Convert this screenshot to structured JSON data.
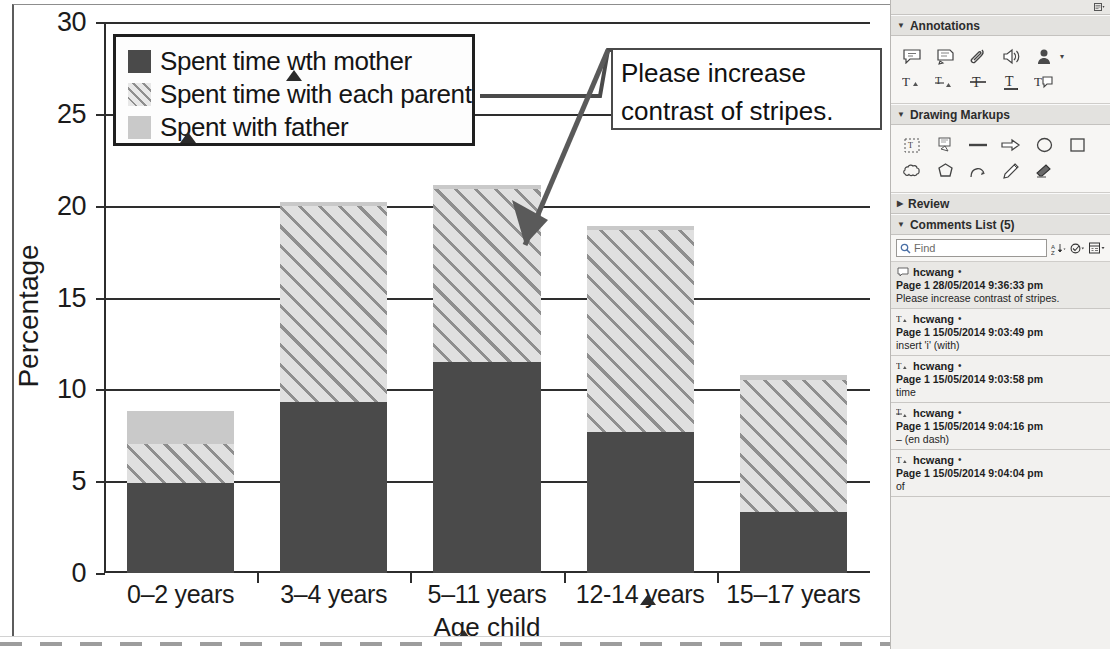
{
  "chart_data": {
    "type": "bar",
    "subtype": "stacked",
    "title": "",
    "xlabel": "Age child",
    "ylabel": "Percentage",
    "ylim": [
      0,
      30
    ],
    "yticks": [
      0,
      5,
      10,
      15,
      20,
      25,
      30
    ],
    "ytick_labels": [
      "0",
      "5",
      "10",
      "15",
      "20",
      "25",
      "30"
    ],
    "grid": true,
    "legend_position": "top-left",
    "categories": [
      "0–2 years",
      "3–4 years",
      "5–11 years",
      "12-14 years",
      "15–17 years"
    ],
    "series": [
      {
        "name": "Spent time wth mother",
        "key": "mother",
        "color": "#4a4a4a",
        "pattern": "solid-dark",
        "values": [
          4.9,
          9.3,
          11.5,
          7.7,
          3.3
        ]
      },
      {
        "name": "Spent time with each parent",
        "key": "each_parent",
        "color": "#e0e0e0",
        "pattern": "diagonal-stripes",
        "values": [
          2.1,
          10.7,
          9.4,
          11.0,
          7.2
        ]
      },
      {
        "name": "Spent with father",
        "key": "father",
        "color": "#c9c9c9",
        "pattern": "solid-light",
        "values": [
          1.8,
          0.2,
          0.2,
          0.2,
          0.3
        ]
      }
    ],
    "totals": [
      8.8,
      20.2,
      21.1,
      18.9,
      10.7
    ]
  },
  "legend": {
    "items": [
      {
        "label": "Spent time wth mother",
        "swatch": "mother"
      },
      {
        "label": "Spent time with each parent",
        "swatch": "each_parent"
      },
      {
        "label": "Spent with father",
        "swatch": "father"
      }
    ]
  },
  "callout": {
    "line1": "Please increase",
    "line2": "contrast of stripes."
  },
  "panel": {
    "sections": {
      "annotations": "Annotations",
      "drawing_markups": "Drawing Markups",
      "review": "Review",
      "comments_list": "Comments List (5)"
    },
    "annotation_tools_row1": [
      "sticky-note-icon",
      "text-highlight-icon",
      "attach-file-icon",
      "record-audio-icon",
      "stamp-icon"
    ],
    "annotation_tools_row2": [
      "insert-text-icon",
      "replace-text-icon",
      "strikethrough-icon",
      "underline-icon",
      "add-note-to-text-icon"
    ],
    "drawing_tools_row1": [
      "text-box-icon",
      "callout-icon",
      "line-icon",
      "arrow-icon",
      "oval-icon",
      "rectangle-icon"
    ],
    "drawing_tools_row2": [
      "cloud-icon",
      "polygon-icon",
      "polyline-icon",
      "pencil-icon",
      "eraser-icon"
    ],
    "find": {
      "placeholder": "Find",
      "sort_icon": "sort-icon",
      "filter_icon": "filter-icon",
      "options_icon": "options-icon"
    },
    "comments": [
      {
        "icon": "sticky-note-icon",
        "author": "hcwang",
        "star": "•",
        "meta": "Page 1  28/05/2014 9:36:33 pm",
        "text": "Please increase contrast of stripes.",
        "selected": true
      },
      {
        "icon": "insert-text-icon",
        "author": "hcwang",
        "star": "•",
        "meta": "Page 1  15/05/2014 9:03:49 pm",
        "text": "insert 'i' (with)",
        "selected": false
      },
      {
        "icon": "insert-text-icon",
        "author": "hcwang",
        "star": "•",
        "meta": "Page 1  15/05/2014 9:03:58 pm",
        "text": "time",
        "selected": false
      },
      {
        "icon": "replace-text-icon",
        "author": "hcwang",
        "star": "•",
        "meta": "Page 1  15/05/2014 9:04:16 pm",
        "text": "– (en dash)",
        "selected": false
      },
      {
        "icon": "insert-text-icon",
        "author": "hcwang",
        "star": "•",
        "meta": "Page 1  15/05/2014 9:04:04 pm",
        "text": "of",
        "selected": false
      }
    ],
    "panel_menu_icon": "panel-options-icon"
  }
}
